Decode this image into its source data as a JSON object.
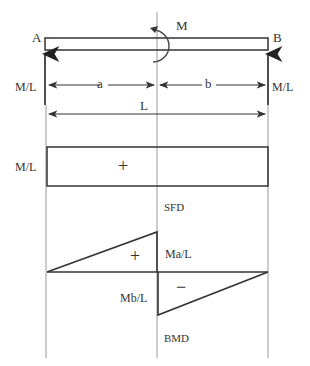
{
  "figure": {
    "type": "beam_diagram"
  },
  "beam": {
    "left_label": "A",
    "right_label": "B",
    "moment_label": "M",
    "left_reaction_label": "M/L",
    "right_reaction_label": "M/L"
  },
  "dimensions": {
    "a_label": "a",
    "b_label": "b",
    "total_label": "L"
  },
  "sfd": {
    "value_label": "M/L",
    "sign": "+",
    "title": "SFD"
  },
  "bmd": {
    "positive_label": "Ma/L",
    "negative_label": "Mb/L",
    "positive_sign": "+",
    "negative_sign": "−",
    "title": "BMD"
  },
  "colors": {
    "line": "#333333",
    "guide": "#9a9a9a",
    "background": "#ffffff"
  }
}
